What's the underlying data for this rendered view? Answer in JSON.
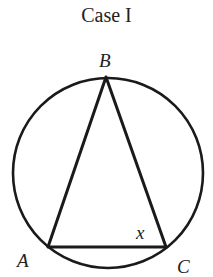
{
  "title": "Case I",
  "figure": {
    "circle": {
      "cx": 108,
      "cy": 173,
      "r": 95
    },
    "points": {
      "B": {
        "label": "B",
        "x": 106,
        "y": 77
      },
      "A": {
        "label": "A",
        "x": 48,
        "y": 247
      },
      "C": {
        "label": "C",
        "x": 166,
        "y": 247
      }
    },
    "angle_label": "x",
    "stroke": "#1a1a1a"
  }
}
